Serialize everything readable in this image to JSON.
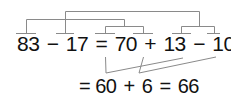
{
  "equation_line_1": {
    "tokens": [
      "83",
      "−",
      "17",
      "=",
      "70",
      "+",
      "13",
      "−",
      "10",
      "−",
      "7"
    ]
  },
  "equation_line_2": {
    "tokens": [
      "=",
      "60",
      "+",
      "6",
      "=",
      "66"
    ]
  },
  "colors": {
    "text": "#111111",
    "lines": "#888888"
  }
}
